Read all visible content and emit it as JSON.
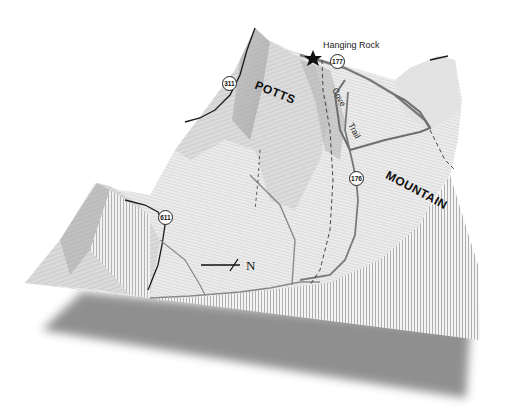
{
  "map": {
    "title_landmark": "Hanging Rock",
    "landmark_icon": "star-icon",
    "place_labels": [
      {
        "text": "POTTS",
        "x": 258,
        "y": 84,
        "rot": 22
      },
      {
        "text": "MOUNTAIN",
        "x": 392,
        "y": 176,
        "rot": 28
      }
    ],
    "trail_label_parts": [
      "Cove",
      "Trail"
    ],
    "route_shields": [
      {
        "number": "311",
        "x": 229,
        "y": 83
      },
      {
        "number": "177",
        "x": 337,
        "y": 61
      },
      {
        "number": "176",
        "x": 356,
        "y": 178
      },
      {
        "number": "611",
        "x": 165,
        "y": 217
      }
    ],
    "north_arrow": {
      "label": "N"
    },
    "colors": {
      "terrain_light": "#e6e6e6",
      "terrain_mid": "#c8c8c8",
      "terrain_dark": "#9a9a9a",
      "road": "#1a1a1a",
      "trail": "#777777",
      "shadow": "#8a8a8a",
      "background": "#ffffff"
    }
  }
}
